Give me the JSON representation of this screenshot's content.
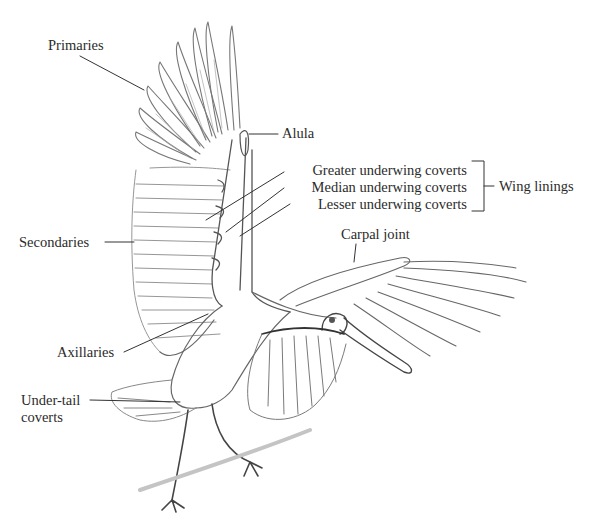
{
  "diagram": {
    "labels": {
      "primaries": "Primaries",
      "alula": "Alula",
      "greater_underwing_coverts": "Greater underwing coverts",
      "median_underwing_coverts": "Median underwing coverts",
      "lesser_underwing_coverts": "Lesser underwing coverts",
      "wing_linings": "Wing linings",
      "secondaries": "Secondaries",
      "carpal_joint": "Carpal joint",
      "axillaries": "Axillaries",
      "under_tail_coverts_line1": "Under-tail",
      "under_tail_coverts_line2": "coverts"
    },
    "colors": {
      "ink": "#2b2b2b",
      "pencil_dark": "#444444",
      "pencil_mid": "#888888",
      "pencil_light": "#bbbbbb",
      "background": "#ffffff"
    }
  }
}
